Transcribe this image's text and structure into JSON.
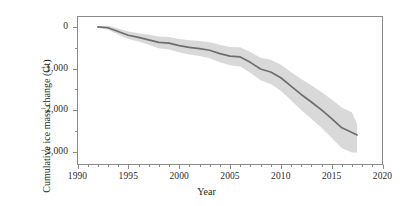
{
  "chart_data": {
    "type": "line",
    "title": "",
    "subtitle": "",
    "xlabel": "Year",
    "ylabel": "Cumulative ice mass change (Gt)",
    "xlim": [
      1990,
      2020
    ],
    "ylim": [
      -3300,
      250
    ],
    "grid": false,
    "legend": null,
    "xticks": [
      1990,
      1995,
      2000,
      2005,
      2010,
      2015,
      2020
    ],
    "xtick_labels": [
      "1990",
      "1995",
      "2000",
      "2005",
      "2010",
      "2015",
      "2020"
    ],
    "x_minor_tick_step": 1,
    "yticks": [
      0,
      -1000,
      -2000,
      -3000
    ],
    "ytick_labels": [
      "0",
      "−1,000",
      "−2,000",
      "−3,000"
    ],
    "y_minor_ticks": [
      -500,
      -1500,
      -2500
    ],
    "x": [
      1992,
      1993,
      1994,
      1995,
      1996,
      1997,
      1998,
      1999,
      2000,
      2001,
      2002,
      2003,
      2004,
      2005,
      2006,
      2007,
      2008,
      2009,
      2010,
      2011,
      2012,
      2013,
      2014,
      2015,
      2016,
      2017,
      2017.5
    ],
    "series": [
      {
        "name": "Cumulative ice mass change",
        "color": "#6e6e6e",
        "values": [
          0,
          -20,
          -110,
          -200,
          -250,
          -310,
          -370,
          -390,
          -450,
          -490,
          -520,
          -560,
          -640,
          -700,
          -720,
          -850,
          -1010,
          -1080,
          -1220,
          -1420,
          -1620,
          -1800,
          -1990,
          -2200,
          -2420,
          -2530,
          -2590
        ]
      }
    ],
    "uncertainty_band": {
      "name": "Uncertainty range",
      "color": "#d9d9d9",
      "upper": [
        20,
        30,
        -40,
        -110,
        -150,
        -190,
        -230,
        -240,
        -290,
        -320,
        -340,
        -370,
        -430,
        -480,
        -490,
        -600,
        -740,
        -790,
        -910,
        -1080,
        -1250,
        -1400,
        -1560,
        -1740,
        -1930,
        -2050,
        -2340
      ],
      "lower": [
        -20,
        -70,
        -180,
        -290,
        -350,
        -430,
        -510,
        -540,
        -610,
        -660,
        -700,
        -750,
        -850,
        -920,
        -950,
        -1100,
        -1280,
        -1370,
        -1530,
        -1760,
        -1990,
        -2200,
        -2420,
        -2660,
        -2910,
        -3010,
        -3010
      ]
    },
    "axis_color": "#808080",
    "background": "#ffffff"
  }
}
